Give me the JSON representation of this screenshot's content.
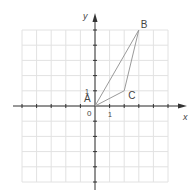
{
  "diagram": {
    "axis_x_label": "x",
    "axis_y_label": "y",
    "origin_label": "0",
    "x_unit_label": "1",
    "y_unit_label": "1",
    "grid_range": {
      "xmin": -5,
      "xmax": 5,
      "ymin": -5,
      "ymax": 5
    },
    "points": [
      {
        "name": "A",
        "x": 0,
        "y": 0
      },
      {
        "name": "B",
        "x": 3,
        "y": 5
      },
      {
        "name": "C",
        "x": 2,
        "y": 1
      }
    ],
    "triangle_color": "#9a9a9a",
    "grid_color": "#e2e2e2",
    "axis_color": "#333333"
  }
}
